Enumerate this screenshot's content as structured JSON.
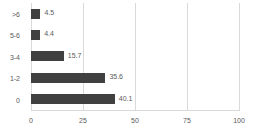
{
  "chart_data": {
    "type": "bar",
    "orientation": "horizontal",
    "title": "",
    "xlabel": "",
    "ylabel": "",
    "xlim": [
      0,
      100
    ],
    "xticks": [
      "0",
      "25",
      "50",
      "75",
      "100"
    ],
    "grid": true,
    "legend": "none",
    "bar_color": "#404040",
    "text_color": "#5a5a5a",
    "gridline_color": "#d9d9d9",
    "background_color": "#ffffff",
    "categories": [
      ">6",
      "5-6",
      "3-4",
      "1-2",
      "0"
    ],
    "values": [
      4.5,
      4.4,
      15.7,
      35.6,
      40.1
    ],
    "data_labels": [
      "4.5",
      "4.4",
      "15.7",
      "35.6",
      "40.1"
    ]
  }
}
